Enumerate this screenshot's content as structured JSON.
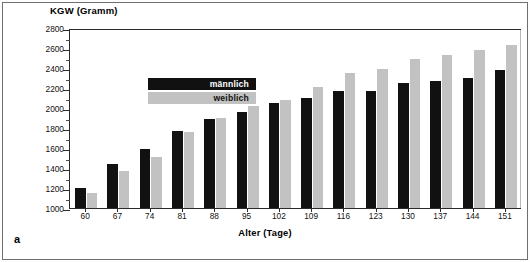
{
  "figure": {
    "panel_label": "a",
    "y_axis_title": "KGW (Gramm)",
    "x_axis_title": "Alter (Tage)"
  },
  "legend": {
    "position": "top-left-inside",
    "items": [
      {
        "label": "männlich",
        "color": "#111111",
        "key": "maennlich"
      },
      {
        "label": "weiblich",
        "color": "#c2c2c2",
        "key": "weiblich"
      }
    ]
  },
  "chart_data": {
    "type": "bar",
    "title": "",
    "subtitle": "",
    "xlabel": "Alter (Tage)",
    "ylabel": "KGW (Gramm)",
    "ylim": [
      1000,
      2800
    ],
    "ytick_step": 200,
    "yticks": [
      1000,
      1200,
      1400,
      1600,
      1800,
      2000,
      2200,
      2400,
      2600,
      2800
    ],
    "ytick_labels": [
      "1000",
      "1200",
      "1400",
      "1600",
      "1800",
      "2000",
      "2200",
      "2400",
      "2600",
      "2800"
    ],
    "grid": false,
    "minor_ticks": true,
    "categories": [
      "60",
      "67",
      "74",
      "81",
      "88",
      "95",
      "102",
      "109",
      "116",
      "123",
      "130",
      "137",
      "144",
      "151"
    ],
    "series": [
      {
        "name": "männlich",
        "color": "#111111",
        "values": [
          1205,
          1440,
          1590,
          1770,
          1890,
          1965,
          2055,
          2100,
          2175,
          2175,
          2255,
          2275,
          2305,
          2385
        ]
      },
      {
        "name": "weiblich",
        "color": "#c2c2c2",
        "values": [
          1155,
          1375,
          1510,
          1760,
          1900,
          2020,
          2085,
          2215,
          2350,
          2395,
          2490,
          2530,
          2580,
          2635
        ]
      }
    ],
    "annotations": [
      "a"
    ],
    "legend_position": "upper left"
  }
}
